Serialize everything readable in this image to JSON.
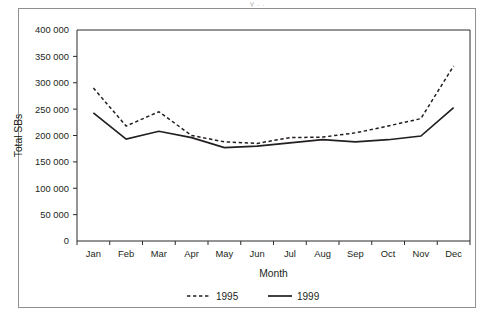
{
  "figure": {
    "clipped_caption": "y   .          .",
    "border_color": "#8e9092",
    "series_color": "#231f20"
  },
  "chart_data": {
    "type": "line",
    "title": "",
    "xlabel": "Month",
    "ylabel": "Total SBs",
    "categories": [
      "Jan",
      "Feb",
      "Mar",
      "Apr",
      "May",
      "Jun",
      "Jul",
      "Aug",
      "Sep",
      "Oct",
      "Nov",
      "Dec"
    ],
    "series": [
      {
        "name": "1995",
        "style": "dashed",
        "values": [
          290000,
          218000,
          245000,
          200000,
          188000,
          185000,
          196000,
          197000,
          205000,
          218000,
          232000,
          332000
        ]
      },
      {
        "name": "1999",
        "style": "solid",
        "values": [
          243000,
          193000,
          208000,
          196000,
          177000,
          180000,
          186000,
          192000,
          188000,
          192000,
          199000,
          253000
        ]
      }
    ],
    "ylim": [
      0,
      400000
    ],
    "ytick_values": [
      0,
      50000,
      100000,
      150000,
      200000,
      250000,
      300000,
      350000,
      400000
    ],
    "ytick_labels": [
      "0",
      "50 000",
      "100 000",
      "150 000",
      "200 000",
      "250 000",
      "300 000",
      "350 000",
      "400 000"
    ],
    "grid": false,
    "legend_position": "bottom",
    "legend_entries": [
      "1995",
      "1999"
    ]
  }
}
